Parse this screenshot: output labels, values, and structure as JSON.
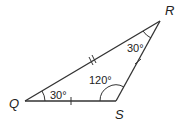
{
  "figure": {
    "type": "triangle",
    "vertices": {
      "Q": "Q",
      "R": "R",
      "S": "S"
    },
    "angles": {
      "Q": "30°",
      "R": "30°",
      "S": "120°"
    },
    "congruence_marks": {
      "QS": "single tick",
      "SR": "single tick",
      "QR": "double tick"
    }
  }
}
